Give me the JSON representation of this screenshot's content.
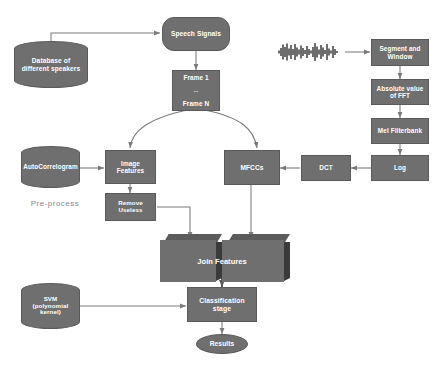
{
  "diagram": {
    "palette": {
      "node_fill": "#6f6f6f",
      "node_stroke": "#5a5a5a",
      "node_text": "#ffffff",
      "cube_shadow": "#3a3a3a",
      "cube_top": "#5c5c5c",
      "connector": "#7a7a7a",
      "plain_text": "#8a8a8a",
      "waveform": "#151515",
      "background": "#ffffff"
    },
    "nodes": [
      {
        "id": "database",
        "label": "Database of different speakers",
        "shape": "cylinder"
      },
      {
        "id": "speech",
        "label": "Speech Signals",
        "shape": "capsule"
      },
      {
        "id": "frames",
        "label": "Frame 1\n...\nFrame N",
        "shape": "rect",
        "lines": [
          "Frame 1",
          "...",
          "Frame N"
        ]
      },
      {
        "id": "waveform",
        "label": "",
        "shape": "waveform",
        "icon": "audio-waveform-icon"
      },
      {
        "id": "segment",
        "label": "Segment and Window",
        "shape": "rect"
      },
      {
        "id": "fft",
        "label": "Absolute value of FFT",
        "shape": "rect"
      },
      {
        "id": "mel",
        "label": "Mel Filterbank",
        "shape": "rect"
      },
      {
        "id": "log",
        "label": "Log",
        "shape": "rect"
      },
      {
        "id": "dct",
        "label": "DCT",
        "shape": "rect"
      },
      {
        "id": "mfccs",
        "label": "MFCCs",
        "shape": "rect"
      },
      {
        "id": "autocorrelogram",
        "label": "AutoCorrelogram",
        "shape": "cylinder"
      },
      {
        "id": "imagefeatures",
        "label": "Image Features",
        "shape": "rect"
      },
      {
        "id": "removeuseless",
        "label": "Remove Useless",
        "shape": "rect"
      },
      {
        "id": "joinfeatures",
        "label": "Join Features",
        "shape": "cube-pair"
      },
      {
        "id": "svm",
        "label": "SVM (polynomial kernel)",
        "shape": "cylinder",
        "lines": [
          "SVM",
          "(polynomial",
          "kernel)"
        ]
      },
      {
        "id": "classification",
        "label": "Classification stage",
        "shape": "rect"
      },
      {
        "id": "results",
        "label": "Results",
        "shape": "ellipse"
      }
    ],
    "annotations": [
      {
        "id": "preprocess",
        "label": "Pre-process"
      }
    ],
    "edges": [
      {
        "from": "database",
        "to": "speech",
        "style": "orthogonal"
      },
      {
        "from": "speech",
        "to": "frames",
        "style": "straight"
      },
      {
        "from": "frames",
        "to": "imagefeatures",
        "style": "curved"
      },
      {
        "from": "frames",
        "to": "mfccs",
        "style": "curved"
      },
      {
        "from": "waveform",
        "to": "segment",
        "style": "straight"
      },
      {
        "from": "segment",
        "to": "fft",
        "style": "straight"
      },
      {
        "from": "fft",
        "to": "mel",
        "style": "straight"
      },
      {
        "from": "mel",
        "to": "log",
        "style": "straight"
      },
      {
        "from": "log",
        "to": "dct",
        "style": "straight"
      },
      {
        "from": "dct",
        "to": "mfccs",
        "style": "straight"
      },
      {
        "from": "autocorrelogram",
        "to": "imagefeatures",
        "style": "straight"
      },
      {
        "from": "imagefeatures",
        "to": "removeuseless",
        "style": "straight"
      },
      {
        "from": "removeuseless",
        "to": "joinfeatures",
        "style": "orthogonal"
      },
      {
        "from": "mfccs",
        "to": "joinfeatures",
        "style": "straight"
      },
      {
        "from": "joinfeatures",
        "to": "classification",
        "style": "straight"
      },
      {
        "from": "svm",
        "to": "classification",
        "style": "straight"
      },
      {
        "from": "classification",
        "to": "results",
        "style": "straight"
      }
    ]
  }
}
